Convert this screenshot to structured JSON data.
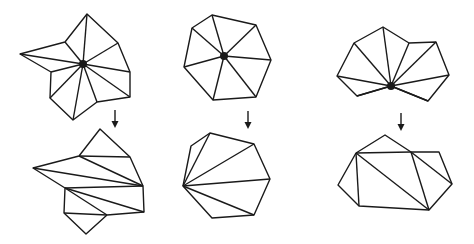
{
  "diagram": {
    "colors": {
      "stroke": "#1a1a1a",
      "background": "#ffffff",
      "vertex": "#1a1a1a"
    },
    "panels": [
      {
        "id": "panel-1",
        "before": {
          "outline": [
            [
              87,
              14
            ],
            [
              118,
              43
            ],
            [
              130,
              72
            ],
            [
              130,
              97
            ],
            [
              97,
              102
            ],
            [
              73,
              120
            ],
            [
              50,
              98
            ],
            [
              51,
              72
            ],
            [
              20,
              54
            ],
            [
              65,
              42
            ]
          ],
          "center": [
            83,
            64
          ],
          "center_radius": 4
        },
        "arrow": {
          "x": 115,
          "y1": 110,
          "y2": 128
        },
        "after": {
          "outline": [
            [
              100,
              129
            ],
            [
              130,
              157
            ],
            [
              143,
              186
            ],
            [
              144,
              212
            ],
            [
              107,
              215
            ],
            [
              86,
              234
            ],
            [
              64,
              213
            ],
            [
              65,
              188
            ],
            [
              33,
              168
            ],
            [
              79,
              156
            ]
          ],
          "diagonals": [
            [
              [
                79,
                156
              ],
              [
                130,
                157
              ]
            ],
            [
              [
                79,
                156
              ],
              [
                143,
                186
              ]
            ],
            [
              [
                33,
                168
              ],
              [
                143,
                186
              ]
            ],
            [
              [
                65,
                188
              ],
              [
                143,
                186
              ]
            ],
            [
              [
                65,
                188
              ],
              [
                144,
                212
              ]
            ],
            [
              [
                65,
                188
              ],
              [
                107,
                215
              ]
            ],
            [
              [
                64,
                213
              ],
              [
                107,
                215
              ]
            ]
          ]
        }
      },
      {
        "id": "panel-2",
        "before": {
          "outline": [
            [
              212,
              15
            ],
            [
              256,
              25
            ],
            [
              271,
              60
            ],
            [
              256,
              97
            ],
            [
              213,
              100
            ],
            [
              184,
              67
            ],
            [
              192,
              28
            ]
          ],
          "center": [
            224,
            56
          ],
          "center_radius": 4
        },
        "arrow": {
          "x": 248,
          "y1": 111,
          "y2": 129
        },
        "after": {
          "outline": [
            [
              210,
              133
            ],
            [
              254,
              144
            ],
            [
              270,
              179
            ],
            [
              254,
              215
            ],
            [
              212,
              218
            ],
            [
              183,
              186
            ],
            [
              191,
              146
            ]
          ],
          "diagonals": [
            [
              [
                183,
                186
              ],
              [
                210,
                133
              ]
            ],
            [
              [
                183,
                186
              ],
              [
                254,
                144
              ]
            ],
            [
              [
                183,
                186
              ],
              [
                270,
                179
              ]
            ],
            [
              [
                183,
                186
              ],
              [
                254,
                215
              ]
            ]
          ]
        }
      },
      {
        "id": "panel-3",
        "before": {
          "outline": [
            [
              354,
              43
            ],
            [
              383,
              27
            ],
            [
              409,
              43
            ],
            [
              436,
              42
            ],
            [
              449,
              75
            ],
            [
              428,
              101
            ],
            [
              391,
              86
            ],
            [
              357,
              96
            ],
            [
              337,
              76
            ]
          ],
          "center": [
            391,
            86
          ],
          "center_radius": 4
        },
        "arrow": {
          "x": 401,
          "y1": 113,
          "y2": 131
        },
        "after": {
          "outline": [
            [
              356,
              153
            ],
            [
              385,
              135
            ],
            [
              411,
              152
            ],
            [
              439,
              152
            ],
            [
              452,
              184
            ],
            [
              429,
              210
            ],
            [
              359,
              206
            ],
            [
              338,
              185
            ]
          ],
          "diagonals": [
            [
              [
                356,
                153
              ],
              [
                411,
                152
              ]
            ],
            [
              [
                356,
                153
              ],
              [
                359,
                206
              ]
            ],
            [
              [
                356,
                153
              ],
              [
                429,
                210
              ]
            ],
            [
              [
                411,
                152
              ],
              [
                429,
                210
              ]
            ],
            [
              [
                411,
                152
              ],
              [
                452,
                184
              ]
            ]
          ]
        }
      }
    ]
  }
}
